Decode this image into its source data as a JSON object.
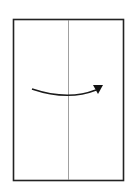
{
  "diagram": {
    "type": "origami-fold-step",
    "paper": {
      "x": 13,
      "y": 19,
      "width": 111,
      "height": 162,
      "border_color": "#222222"
    },
    "crease": {
      "orientation": "vertical",
      "x": 68,
      "color": "#777777"
    },
    "arrow": {
      "direction": "left-to-right",
      "curve": "downward-arc",
      "color": "#1a1a1a"
    }
  }
}
